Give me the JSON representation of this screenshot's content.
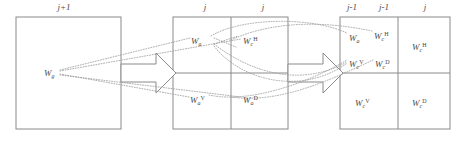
{
  "figure": {
    "stroke_color": "#8a8a8a",
    "dot_color": "#9a9a9a",
    "text_color": "#4a4a4a",
    "background": "#ffffff"
  },
  "scale_labels": [
    {
      "id": "scale-left",
      "text": "j+1",
      "x": 63,
      "y": 3
    },
    {
      "id": "scale-mid-left",
      "text": "j",
      "x": 205,
      "y": 3
    },
    {
      "id": "scale-mid-right",
      "text": "j",
      "x": 263,
      "y": 3
    },
    {
      "id": "scale-right-a",
      "text": "j-1",
      "x": 350,
      "y": 3
    },
    {
      "id": "scale-right-b",
      "text": "j-1",
      "x": 382,
      "y": 3
    },
    {
      "id": "scale-right-c",
      "text": "j",
      "x": 424,
      "y": 3
    }
  ],
  "panels": {
    "left": {
      "x": 16,
      "y": 17,
      "w": 105,
      "h": 112
    },
    "middle": {
      "x": 173,
      "y": 17,
      "w": 115,
      "h": 112,
      "split_x": 231,
      "split_y": 73
    },
    "right": {
      "x": 340,
      "y": 17,
      "w": 112,
      "h": 112,
      "split_x": 398,
      "split_y": 73
    }
  },
  "coefficient_labels": [
    {
      "id": "w-left",
      "base": "W",
      "sub": "g",
      "sup": "",
      "x": 44,
      "y": 66
    },
    {
      "id": "w-mid-a",
      "base": "W",
      "sub": "a",
      "sup": "",
      "x": 191,
      "y": 36
    },
    {
      "id": "w-mid-ch",
      "base": "W",
      "sub": "c",
      "sup": "H",
      "x": 243,
      "y": 37
    },
    {
      "id": "w-mid-av",
      "base": "W",
      "sub": "a",
      "sup": "V",
      "x": 190,
      "y": 95
    },
    {
      "id": "w-mid-ad",
      "base": "W",
      "sub": "a",
      "sup": "D",
      "x": 243,
      "y": 95
    },
    {
      "id": "w-right-a",
      "base": "W",
      "sub": "a",
      "sup": "",
      "x": 349,
      "y": 33
    },
    {
      "id": "w-right-ch-sm",
      "base": "W",
      "sub": "c",
      "sup": "H",
      "x": 374,
      "y": 30
    },
    {
      "id": "w-right-cv-sm",
      "base": "W",
      "sub": "c",
      "sup": "V",
      "x": 349,
      "y": 59
    },
    {
      "id": "w-right-cd-sm",
      "base": "W",
      "sub": "c",
      "sup": "D",
      "x": 375,
      "y": 59
    },
    {
      "id": "w-right-ch-big",
      "base": "W",
      "sub": "c",
      "sup": "H",
      "x": 412,
      "y": 40
    },
    {
      "id": "w-right-cv-big",
      "base": "W",
      "sub": "c",
      "sup": "V",
      "x": 355,
      "y": 96
    },
    {
      "id": "w-right-cd-big",
      "base": "W",
      "sub": "c",
      "sup": "D",
      "x": 412,
      "y": 96
    }
  ],
  "arrows": [
    {
      "id": "block-arrow-left",
      "from_x": 121,
      "to_x": 173,
      "mid_y": 73
    },
    {
      "id": "block-arrow-right",
      "from_x": 288,
      "to_x": 340,
      "mid_y": 73
    }
  ],
  "connectors": {
    "style": "dotted",
    "description": "dotted fan-out curves linking coarse coefficients to finer-scale subbands"
  }
}
